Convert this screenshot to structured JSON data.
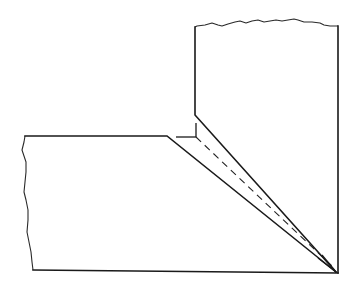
{
  "diagram": {
    "type": "technical-drawing",
    "colors": {
      "background": "#ffffff",
      "line": "#1a1a1a"
    },
    "parts": [
      {
        "name": "vertical-member",
        "description": "upright plate with broken (wavy) top edge and beveled lower-left edge"
      },
      {
        "name": "horizontal-member",
        "description": "horizontal plate with broken (wavy) left edge and beveled right end"
      },
      {
        "name": "groove",
        "description": "V-shaped gap between the two bevels meeting at the bottom-right corner"
      },
      {
        "name": "root-detail",
        "description": "short right-angle tick marks at the root opening"
      },
      {
        "name": "centerline",
        "description": "dashed line running down the groove to the corner"
      }
    ],
    "labels": []
  }
}
